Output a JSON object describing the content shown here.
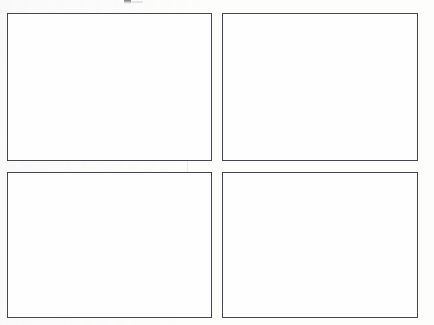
{
  "document": {
    "kind": "scanned-page",
    "page_background_color": "#fdfdfc",
    "width_px": 434,
    "height_px": 325,
    "visible_text": "",
    "caption": "",
    "page_number": ""
  },
  "figure": {
    "layout": "2x2 grid of empty framed panels",
    "panel_border_color": "#46464a",
    "panel_fill_color": "#fefefe",
    "panel_border_width_px": 1,
    "panels": [
      {
        "id": "top-left",
        "label": "",
        "content": "",
        "x": 7,
        "y": 13,
        "width": 205,
        "height": 148
      },
      {
        "id": "top-right",
        "label": "",
        "content": "",
        "x": 222,
        "y": 13,
        "width": 196,
        "height": 148
      },
      {
        "id": "bottom-left",
        "label": "",
        "content": "",
        "x": 7,
        "y": 172,
        "width": 205,
        "height": 146
      },
      {
        "id": "bottom-right",
        "label": "",
        "content": "",
        "x": 222,
        "y": 172,
        "width": 196,
        "height": 146
      }
    ]
  },
  "artifacts": {
    "clipped_text_remnant": {
      "description": "faint clipped ink at top center from text cut off above page edge",
      "x": 124,
      "y": 0
    },
    "scan_seam": {
      "description": "faint vertical scanner seam through left column",
      "x": 187,
      "color": "#aaacb2"
    }
  }
}
